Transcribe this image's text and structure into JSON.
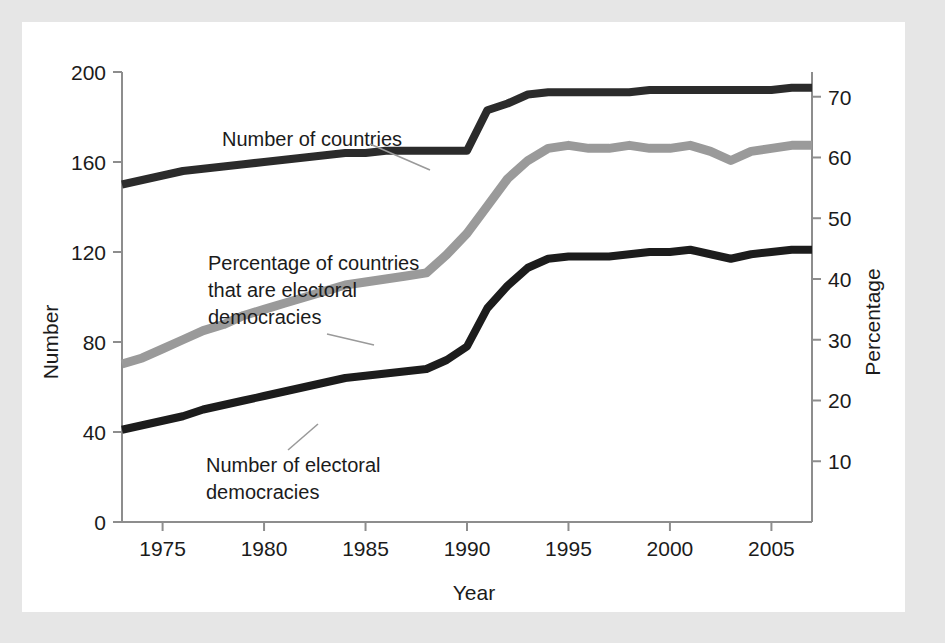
{
  "chart_data": {
    "type": "line",
    "title": "",
    "xlabel": "Year",
    "ylabel": "Number",
    "y2label": "Percentage",
    "xlim": [
      1973,
      2007
    ],
    "ylim": [
      0,
      200
    ],
    "y2lim": [
      0,
      74.07
    ],
    "grid": false,
    "legend": "annotations on plot",
    "xticks": [
      "1975",
      "1980",
      "1985",
      "1990",
      "1995",
      "2000",
      "2005"
    ],
    "xtick_values": [
      1975,
      1980,
      1985,
      1990,
      1995,
      2000,
      2005
    ],
    "yticks": [
      "0",
      "40",
      "80",
      "120",
      "160",
      "200"
    ],
    "ytick_values": [
      0,
      40,
      80,
      120,
      160,
      200
    ],
    "y2ticks": [
      "10",
      "20",
      "30",
      "40",
      "50",
      "60",
      "70"
    ],
    "y2tick_values": [
      10,
      20,
      30,
      40,
      50,
      60,
      70
    ],
    "x": [
      1973,
      1974,
      1975,
      1976,
      1977,
      1978,
      1979,
      1980,
      1981,
      1982,
      1983,
      1984,
      1985,
      1986,
      1987,
      1988,
      1989,
      1990,
      1991,
      1992,
      1993,
      1994,
      1995,
      1996,
      1997,
      1998,
      1999,
      2000,
      2001,
      2002,
      2003,
      2004,
      2005,
      2006,
      2007
    ],
    "series": [
      {
        "name": "Number of countries",
        "axis": "left",
        "color": "#2b2b2b",
        "values": [
          150,
          152,
          154,
          156,
          157,
          158,
          159,
          160,
          161,
          162,
          163,
          164,
          164,
          165,
          165,
          165,
          165,
          165,
          183,
          186,
          190,
          191,
          191,
          191,
          191,
          191,
          192,
          192,
          192,
          192,
          192,
          192,
          192,
          193,
          193
        ]
      },
      {
        "name": "Percentage of countries that are electoral democracies",
        "axis": "right",
        "color": "#9a9a9a",
        "values": [
          26.0,
          27.0,
          28.5,
          30.0,
          31.5,
          32.5,
          34.0,
          35.0,
          36.0,
          37.0,
          38.0,
          39.0,
          39.5,
          40.0,
          40.5,
          41.0,
          44.0,
          47.5,
          52.0,
          56.5,
          59.5,
          61.5,
          62.0,
          61.5,
          61.5,
          62.0,
          61.5,
          61.5,
          62.0,
          61.0,
          59.5,
          61.0,
          61.5,
          62.0,
          62.0
        ]
      },
      {
        "name": "Number of electoral democracies",
        "axis": "left",
        "color": "#1c1c1c",
        "values": [
          41,
          43,
          45,
          47,
          50,
          52,
          54,
          56,
          58,
          60,
          62,
          64,
          65,
          66,
          67,
          68,
          72,
          78,
          95,
          105,
          113,
          117,
          118,
          118,
          118,
          119,
          120,
          120,
          121,
          119,
          117,
          119,
          120,
          121,
          121
        ]
      }
    ],
    "annotations": [
      {
        "name": "Number of countries",
        "lines": [
          "Number of countries"
        ],
        "text_x": 200,
        "text_y": 124,
        "leader": [
          [
            348,
            122
          ],
          [
            408,
            148
          ]
        ]
      },
      {
        "name": "Percentage of countries that are electoral democracies",
        "lines": [
          "Percentage of countries",
          "that are electoral",
          "democracies"
        ],
        "text_x": 186,
        "text_y": 248,
        "leader": [
          [
            305,
            312
          ],
          [
            352,
            323
          ]
        ]
      },
      {
        "name": "Number of electoral democracies",
        "lines": [
          "Number of electoral",
          "democracies"
        ],
        "text_x": 184,
        "text_y": 450,
        "leader": [
          [
            266,
            428
          ],
          [
            296,
            402
          ]
        ]
      }
    ]
  },
  "figure": {
    "background_color": "#e6e6e6",
    "card_color": "#ffffff",
    "axis_color": "#8d8d8d",
    "text_color": "#1b1b1b"
  }
}
